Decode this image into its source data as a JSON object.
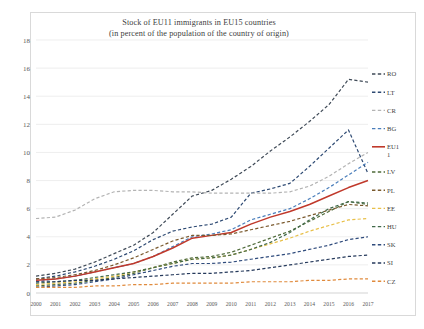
{
  "chart_data": {
    "type": "line",
    "title": "Stock of EU11 immigrants in EU15 countries",
    "subtitle": "(in percent of the population of the country of origin)",
    "xlabel": "",
    "ylabel": "",
    "ylim": [
      0,
      18
    ],
    "yticks": [
      0,
      2,
      4,
      6,
      8,
      10,
      12,
      14,
      16,
      18
    ],
    "grid": true,
    "legend_position": "right",
    "x": [
      2000,
      2001,
      2002,
      2003,
      2004,
      2005,
      2006,
      2007,
      2008,
      2009,
      2010,
      2011,
      2012,
      2013,
      2014,
      2015,
      2016,
      2017
    ],
    "categories": [
      "2000",
      "2001",
      "2002",
      "2003",
      "2004",
      "2005",
      "2006",
      "2007",
      "2008",
      "2009",
      "2010",
      "2011",
      "2012",
      "2013",
      "2014",
      "2015",
      "2016",
      "2017"
    ],
    "series": [
      {
        "name": "RO",
        "color": "#3f4a57",
        "style": "dashed",
        "values": [
          1.2,
          1.4,
          1.7,
          2.2,
          2.8,
          3.4,
          4.3,
          5.6,
          6.9,
          7.3,
          8.1,
          9.0,
          10.1,
          11.1,
          12.2,
          13.4,
          15.2,
          15.0
        ]
      },
      {
        "name": "LT",
        "color": "#2e4a73",
        "style": "dashed",
        "values": [
          1.0,
          1.2,
          1.5,
          1.9,
          2.4,
          3.0,
          3.8,
          4.4,
          4.7,
          4.9,
          5.4,
          7.1,
          7.4,
          7.8,
          9.0,
          10.3,
          11.6,
          8.5
        ]
      },
      {
        "name": "CR",
        "color": "#b4b4b4",
        "style": "dashed",
        "values": [
          5.3,
          5.4,
          5.9,
          6.7,
          7.2,
          7.3,
          7.3,
          7.2,
          7.2,
          7.1,
          7.1,
          7.1,
          7.1,
          7.2,
          7.6,
          8.3,
          9.2,
          10.0
        ]
      },
      {
        "name": "BG",
        "color": "#4a7ebb",
        "style": "dashed",
        "values": [
          0.8,
          1.0,
          1.2,
          1.5,
          1.8,
          2.1,
          2.6,
          3.3,
          4.0,
          4.2,
          4.5,
          5.2,
          5.6,
          6.0,
          6.7,
          7.5,
          8.4,
          9.3
        ]
      },
      {
        "name": "EU11",
        "color": "#c0392b",
        "style": "solid",
        "values": [
          0.9,
          1.0,
          1.2,
          1.5,
          1.8,
          2.1,
          2.6,
          3.2,
          3.9,
          4.1,
          4.3,
          4.9,
          5.4,
          5.8,
          6.3,
          6.9,
          7.5,
          8.0
        ]
      },
      {
        "name": "LV",
        "color": "#4f6b3a",
        "style": "dashed",
        "values": [
          0.5,
          0.6,
          0.7,
          0.9,
          1.1,
          1.4,
          1.8,
          2.2,
          2.5,
          2.6,
          2.9,
          3.4,
          3.9,
          4.4,
          5.1,
          5.8,
          6.5,
          6.3
        ]
      },
      {
        "name": "PL",
        "color": "#7a5a2e",
        "style": "dashed",
        "values": [
          1.0,
          1.1,
          1.3,
          1.6,
          2.0,
          2.5,
          3.1,
          3.7,
          4.1,
          4.1,
          4.2,
          4.5,
          4.8,
          5.1,
          5.5,
          5.9,
          6.3,
          6.2
        ]
      },
      {
        "name": "EE",
        "color": "#e8c04a",
        "style": "dashed",
        "values": [
          0.6,
          0.7,
          0.8,
          1.0,
          1.2,
          1.5,
          1.8,
          2.1,
          2.4,
          2.5,
          2.7,
          3.1,
          3.5,
          3.9,
          4.4,
          4.8,
          5.2,
          5.3
        ]
      },
      {
        "name": "HU",
        "color": "#41694a",
        "style": "dashed",
        "values": [
          0.7,
          0.8,
          0.9,
          1.1,
          1.3,
          1.5,
          1.8,
          2.1,
          2.4,
          2.5,
          2.7,
          3.1,
          3.6,
          4.3,
          5.2,
          6.0,
          6.5,
          6.4
        ]
      },
      {
        "name": "SK",
        "color": "#2f4b7c",
        "style": "dashed",
        "values": [
          0.4,
          0.5,
          0.6,
          0.8,
          1.0,
          1.3,
          1.6,
          1.9,
          2.1,
          2.1,
          2.2,
          2.4,
          2.6,
          2.8,
          3.1,
          3.4,
          3.8,
          4.0
        ]
      },
      {
        "name": "SI",
        "color": "#263a5c",
        "style": "dashed",
        "values": [
          0.8,
          0.8,
          0.9,
          0.9,
          1.0,
          1.1,
          1.2,
          1.3,
          1.4,
          1.4,
          1.5,
          1.6,
          1.8,
          2.0,
          2.2,
          2.4,
          2.6,
          2.7
        ]
      },
      {
        "name": "CZ",
        "color": "#e08a3c",
        "style": "dashed",
        "values": [
          0.4,
          0.4,
          0.4,
          0.5,
          0.5,
          0.6,
          0.6,
          0.7,
          0.7,
          0.7,
          0.7,
          0.8,
          0.8,
          0.8,
          0.9,
          0.9,
          1.0,
          1.0
        ]
      }
    ],
    "legend_entries": [
      {
        "label": "RO"
      },
      {
        "label": "LT"
      },
      {
        "label": "CR"
      },
      {
        "label": "BG"
      },
      {
        "label": "EU11"
      },
      {
        "label": "LV"
      },
      {
        "label": "PL"
      },
      {
        "label": "EE"
      },
      {
        "label": "HU"
      },
      {
        "label": "SK"
      },
      {
        "label": "SI"
      },
      {
        "label": "CZ"
      }
    ]
  }
}
